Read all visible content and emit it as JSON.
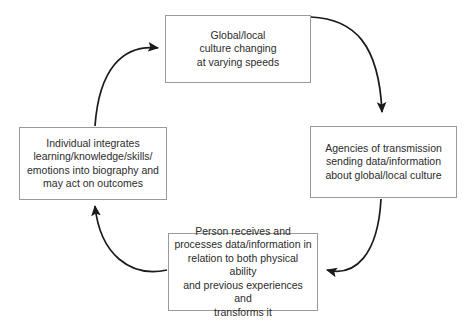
{
  "diagram": {
    "type": "cycle",
    "direction": "clockwise",
    "colors": {
      "background": "#ffffff",
      "box_border": "#9a9a9a",
      "arrow": "#1a1a1a",
      "text": "#2b2b2b"
    },
    "nodes": [
      {
        "id": "top",
        "text": "Global/local\nculture changing\nat varying speeds"
      },
      {
        "id": "right",
        "text": "Agencies of transmission\nsending data/information\nabout global/local culture"
      },
      {
        "id": "bottom",
        "text": "Person receives and\nprocesses data/information in\nrelation to both physical ability\nand previous experiences and\ntransforms it"
      },
      {
        "id": "left",
        "text": "Individual integrates\nlearning/knowledge/skills/\nemotions into biography and\nmay act on outcomes"
      }
    ],
    "edges": [
      {
        "id": "top-to-right",
        "from": "top",
        "to": "right"
      },
      {
        "id": "right-to-bottom",
        "from": "right",
        "to": "bottom"
      },
      {
        "id": "bottom-to-left",
        "from": "bottom",
        "to": "left"
      },
      {
        "id": "left-to-top",
        "from": "left",
        "to": "top"
      }
    ]
  }
}
